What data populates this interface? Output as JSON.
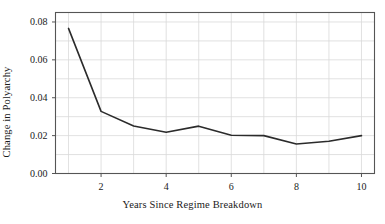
{
  "chart_data": {
    "type": "line",
    "title": "",
    "xlabel": "Years Since Regime Breakdown",
    "ylabel": "Change in Polyarchy",
    "x": [
      1,
      2,
      3,
      4,
      5,
      6,
      7,
      8,
      9,
      10
    ],
    "values": [
      0.0766,
      0.0328,
      0.0251,
      0.0218,
      0.025,
      0.0202,
      0.02,
      0.0156,
      0.017,
      0.02
    ],
    "series": [
      {
        "name": "Change in Polyarchy",
        "values": [
          0.0766,
          0.0328,
          0.0251,
          0.0218,
          0.025,
          0.0202,
          0.02,
          0.0156,
          0.017,
          0.02
        ]
      }
    ],
    "xlim": [
      0.6,
      10.4
    ],
    "ylim": [
      0.0,
      0.085
    ],
    "xticks": [
      2,
      4,
      6,
      8,
      10
    ],
    "xticklabels": [
      "2",
      "4",
      "6",
      "8",
      "10"
    ],
    "yticks": [
      0.0,
      0.02,
      0.04,
      0.06,
      0.08
    ],
    "yticklabels": [
      "0.00",
      "0.02",
      "0.04",
      "0.06",
      "0.08"
    ],
    "grid": true,
    "grid_color": "#d9d9d9",
    "legend": null,
    "line_color": "#2b2b2b",
    "line_width": 1.6,
    "frame_color": "#555555",
    "background": "#ffffff"
  }
}
